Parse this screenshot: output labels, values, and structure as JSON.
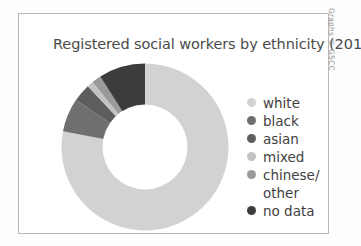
{
  "figure": {
    "title": "Registered social workers by ethnicity (2010)",
    "credit": "Graphs © GSCC",
    "panel_border_color": "#b9b9b9",
    "background_color": "#ffffff",
    "title_color": "#4a4a4a"
  },
  "chart_data": {
    "type": "pie",
    "variant": "donut",
    "title": "Registered social workers by ethnicity (2010)",
    "start_angle_deg": 0,
    "direction": "clockwise",
    "hole_fraction": 0.5,
    "legend_position": "right",
    "labels": [
      "white",
      "black",
      "asian",
      "mixed",
      "chinese/other",
      "no data"
    ],
    "values": [
      78.0,
      6.5,
      3.5,
      1.2,
      1.8,
      9.0
    ],
    "unit": "percent",
    "colors": [
      "#d2d2d2",
      "#6f6f6f",
      "#5e5e5e",
      "#c3c3c3",
      "#9a9a9a",
      "#3c3c3c"
    ],
    "slices": [
      {
        "label": "white",
        "value": 78.0,
        "color": "#d2d2d2"
      },
      {
        "label": "black",
        "value": 6.5,
        "color": "#6f6f6f"
      },
      {
        "label": "asian",
        "value": 3.5,
        "color": "#5e5e5e"
      },
      {
        "label": "mixed",
        "value": 1.2,
        "color": "#c3c3c3"
      },
      {
        "label": "chinese/other",
        "value": 1.8,
        "color": "#9a9a9a"
      },
      {
        "label": "no data",
        "value": 9.0,
        "color": "#3c3c3c"
      }
    ]
  },
  "legend": {
    "items": [
      {
        "label": "white",
        "color": "#d2d2d2",
        "second_line": ""
      },
      {
        "label": "black",
        "color": "#6f6f6f",
        "second_line": ""
      },
      {
        "label": "asian",
        "color": "#5e5e5e",
        "second_line": ""
      },
      {
        "label": "mixed",
        "color": "#c3c3c3",
        "second_line": ""
      },
      {
        "label": "chinese/",
        "color": "#9a9a9a",
        "second_line": "other"
      },
      {
        "label": "no data",
        "color": "#3c3c3c",
        "second_line": ""
      }
    ]
  }
}
